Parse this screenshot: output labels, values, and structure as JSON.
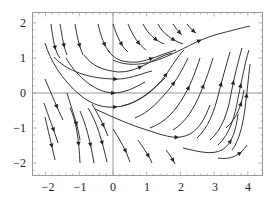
{
  "chart_data": {
    "type": "streamplot",
    "title": "",
    "xlabel": "",
    "ylabel": "",
    "xlim": [
      -2.4,
      4.4
    ],
    "ylim": [
      -2.3,
      2.3
    ],
    "x_ticks": [
      -2,
      -1,
      0,
      1,
      2,
      3,
      4
    ],
    "y_ticks": [
      -2,
      -1,
      0,
      1,
      2
    ],
    "x_tick_labels": [
      "−2",
      "−1",
      "0",
      "1",
      "2",
      "3",
      "4"
    ],
    "y_tick_labels": [
      "−2",
      "−1",
      "0",
      "1",
      "2"
    ],
    "grid": false,
    "axes_origin_lines": true,
    "legend": null,
    "stream_color": "#333333",
    "frame_color": "#999999"
  }
}
